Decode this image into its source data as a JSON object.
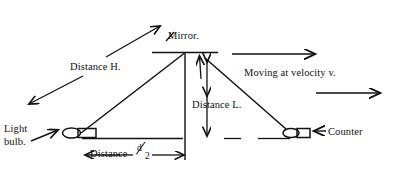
{
  "figure": {
    "background_color": "#ffffff",
    "ink_color": "#111111",
    "width": 396,
    "height": 172
  },
  "labels": {
    "light_bulb_line1": "Light",
    "light_bulb_line2": "bulb.",
    "distance_h": "Distance H.",
    "mirror": "Mirror.",
    "distance_l": "Distance L.",
    "moving": "Moving at velocity v.",
    "counter": "Counter",
    "distance_d_word": "Distance",
    "distance_d_numerator": "d",
    "distance_d_denominator": "2"
  },
  "elements": {
    "mirror_bar": "mirror-horizontal-bar",
    "baseline": "ground-baseline",
    "light_bulb_glyph": "light-bulb-shape",
    "counter_glyph": "counter-detector-shape",
    "beam_up": "light-beam-up-to-mirror",
    "beam_down": "light-beam-down-to-counter",
    "vertical_axis": "mirror-vertical-drop-line",
    "velocity_arrow_upper": "velocity-arrow-upper",
    "velocity_arrow_lower": "velocity-arrow-lower",
    "h_leader_upper": "distance-h-leader-upper",
    "h_leader_lower": "distance-h-leader-lower",
    "l_arrow": "distance-l-double-arrow",
    "d_arrow": "distance-d-double-arrow",
    "mirror_pointer": "mirror-label-pointer",
    "bulb_pointer": "light-bulb-label-pointer",
    "counter_pointer": "counter-label-pointer",
    "mirror_up_arrow": "beam-direction-arrow-to-mirror"
  }
}
